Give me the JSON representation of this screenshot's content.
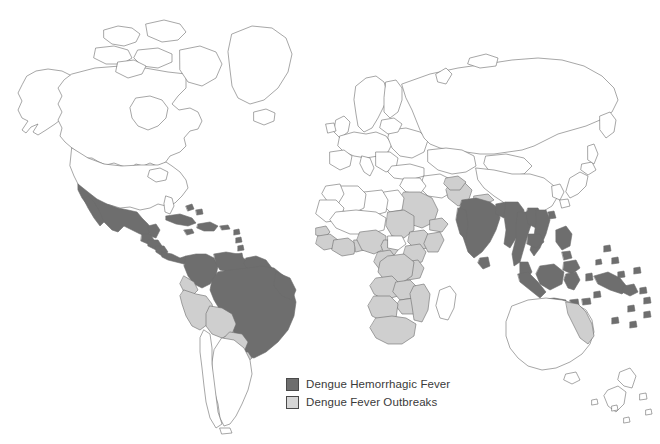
{
  "figure": {
    "type": "choropleth-world-map",
    "background_color": "#ffffff",
    "outline_color": "#6b6b6b"
  },
  "legend": {
    "position": "bottom-center",
    "items": [
      {
        "label": "Dengue Hemorrhagic Fever",
        "swatch": "dark",
        "color": "#6e6e6e"
      },
      {
        "label": "Dengue Fever Outbreaks",
        "swatch": "light",
        "color": "#d6d6d6"
      }
    ]
  },
  "map_data": {
    "categories": [
      "Dengue Hemorrhagic Fever",
      "Dengue Fever Outbreaks",
      "No data"
    ],
    "colors": {
      "Dengue Hemorrhagic Fever": "#6e6e6e",
      "Dengue Fever Outbreaks": "#cfcfcf",
      "No data": "#ffffff"
    },
    "regions_dengue_hemorrhagic_fever": [
      "Mexico",
      "Guatemala",
      "Belize",
      "Honduras",
      "El Salvador",
      "Nicaragua",
      "Costa Rica",
      "Panama",
      "Cuba",
      "Jamaica",
      "Haiti",
      "Dominican Republic",
      "Puerto Rico",
      "Lesser Antilles",
      "Trinidad and Tobago",
      "Venezuela",
      "Colombia",
      "Guyana",
      "Suriname",
      "French Guiana",
      "Brazil",
      "India",
      "Sri Lanka",
      "Bangladesh",
      "Myanmar",
      "Thailand",
      "Laos",
      "Cambodia",
      "Vietnam",
      "Malaysia",
      "Singapore",
      "Indonesia",
      "Philippines",
      "Papua New Guinea",
      "Solomon Islands",
      "Pacific Islands"
    ],
    "regions_dengue_fever_outbreaks": [
      "Ecuador",
      "Peru",
      "Bolivia",
      "Paraguay",
      "Senegal",
      "Gambia",
      "Guinea",
      "Sierra Leone",
      "Liberia",
      "Ivory Coast",
      "Ghana",
      "Togo",
      "Benin",
      "Nigeria",
      "Cameroon",
      "Gabon",
      "Congo",
      "Democratic Republic of the Congo",
      "Angola",
      "Zambia",
      "Zimbabwe",
      "Mozambique",
      "Tanzania",
      "Kenya",
      "Uganda",
      "Somalia",
      "Sudan",
      "South Africa",
      "Namibia",
      "Madagascar",
      "Pakistan",
      "Nepal",
      "Saudi Arabia",
      "Yemen",
      "Northeastern Australia"
    ],
    "regions_no_data": [
      "Canada",
      "United States",
      "Greenland",
      "Iceland",
      "Europe",
      "Russia",
      "China",
      "Mongolia",
      "Japan",
      "Korea",
      "North Africa",
      "Argentina",
      "Chile",
      "Uruguay",
      "Most of Australia",
      "New Zealand",
      "Antarctica"
    ]
  }
}
